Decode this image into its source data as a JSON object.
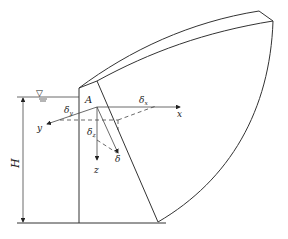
{
  "diagram": {
    "type": "arch-dam-stress-sketch",
    "labels": {
      "point": "A",
      "height": "H",
      "axis_x": "x",
      "axis_y": "y",
      "axis_z": "z",
      "delta_x": "δ",
      "delta_x_sub": "x",
      "delta_y": "δ",
      "delta_y_sub": "y",
      "delta_z": "δ",
      "delta_z_sub": "z",
      "delta": "δ",
      "water_symbol": "▽"
    },
    "colors": {
      "line": "#333333",
      "background": "#ffffff"
    }
  }
}
